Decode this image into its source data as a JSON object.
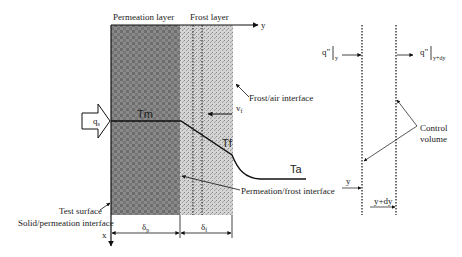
{
  "left_diagram": {
    "header_permeation": "Permeation layer",
    "header_frost": "Frost layer",
    "axis_y_label": "y",
    "axis_x_label": "x",
    "heat_flux_label": "q",
    "heat_flux_sub": "s",
    "temp_m": "Tm",
    "temp_f": "Tf",
    "temp_a": "Ta",
    "velocity_label": "v",
    "velocity_sub": "f",
    "frost_air_interface": "Frost/air interface",
    "permeation_frost_interface": "Permeation/frost interface",
    "test_surface": "Test surface",
    "solid_permeation_interface": "Solid/permeation interface",
    "delta_p": "δ",
    "delta_p_sub": "p",
    "delta_f": "δ",
    "delta_f_sub": "f",
    "colors": {
      "permeation_fill": "#7a7a7a",
      "frost_fill": "#c8c8c8",
      "line": "#111111"
    }
  },
  "right_diagram": {
    "flux_in": "q\"",
    "flux_in_sub": "y",
    "flux_out": "q\"",
    "flux_out_sub": "y+dy",
    "control_volume_line1": "Control",
    "control_volume_line2": "volume",
    "y_label": "y",
    "ydy_label": "y+dy"
  }
}
